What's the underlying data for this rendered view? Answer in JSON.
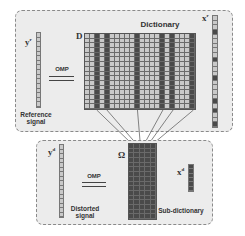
{
  "top_panel": {
    "title": "Dictionary",
    "matrix_symbol": "D",
    "reference_vector_symbol": "y",
    "reference_vector_sup": "r",
    "coef_vector_symbol": "x",
    "coef_vector_sup": "r",
    "operator_label": "OMP",
    "signal_label_line1": "Reference",
    "signal_label_line2": "signal"
  },
  "bottom_panel": {
    "matrix_symbol": "Ω",
    "distorted_vector_symbol": "y",
    "distorted_vector_sup": "d",
    "coef_vector_symbol": "x",
    "coef_vector_sup": "d",
    "operator_label": "OMP",
    "signal_label_line1": "Distorted",
    "signal_label_line2": "signal",
    "subdict_label": "Sub-dictionary"
  },
  "dictionary": {
    "columns": 22,
    "rows": 16,
    "selected_columns": [
      3,
      5,
      11,
      16,
      19,
      23
    ]
  },
  "subdictionary": {
    "columns": 5,
    "rows": 16
  },
  "vectors": {
    "yr_cells": 16,
    "xr_cells": 24,
    "xr_dark": [
      3,
      9,
      13,
      18,
      20,
      23
    ],
    "yd_cells": 16,
    "xd_cells": 6
  },
  "colors": {
    "panel_bg": "#ececec",
    "cell_light": "#c9c9c9",
    "cell_dark": "#4a4a4a",
    "border": "#8a8a8a"
  }
}
